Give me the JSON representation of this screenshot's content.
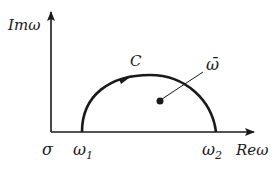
{
  "diagram": {
    "type": "complex-plane contour",
    "axes": {
      "vertical_label": "Imω",
      "horizontal_label": "Reω",
      "origin_label": "σ"
    },
    "points": {
      "start_label": "ω",
      "start_subscript": "1",
      "end_label": "ω",
      "end_subscript": "2",
      "interior_point_label": "ω̄"
    },
    "contour_label": "C",
    "colors": {
      "stroke": "#1a1a1a",
      "background": "#ffffff"
    }
  }
}
